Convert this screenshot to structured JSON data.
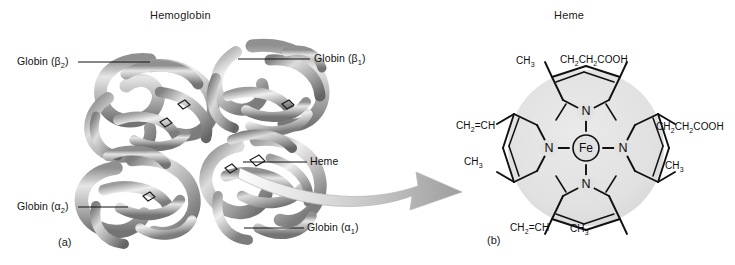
{
  "figure": {
    "panels": [
      {
        "id": "a",
        "caption": "(a)",
        "title": "Hemoglobin",
        "subject": "hemoglobin-quaternary-structure",
        "labels": [
          {
            "name": "globin-beta2",
            "text": "Globin (β",
            "sub": "2",
            "tail": ")"
          },
          {
            "name": "globin-beta1",
            "text": "Globin (β",
            "sub": "1",
            "tail": ")"
          },
          {
            "name": "globin-alpha2",
            "text": "Globin (α",
            "sub": "2",
            "tail": ")"
          },
          {
            "name": "globin-alpha1",
            "text": "Globin (α",
            "sub": "1",
            "tail": ")"
          },
          {
            "name": "heme-callout",
            "text": "Heme",
            "sub": "",
            "tail": ""
          }
        ]
      },
      {
        "id": "b",
        "caption": "(b)",
        "title": "Heme",
        "subject": "heme-iron-porphyrin-structure",
        "center_atom": "Fe",
        "nitrogen_atoms": [
          "N",
          "N",
          "N",
          "N"
        ],
        "substituents": [
          {
            "name": "methyl-top-left",
            "formula_parts": [
              "CH",
              "3"
            ]
          },
          {
            "name": "propionate-top-right",
            "formula_parts": [
              "CH",
              "2",
              "CH",
              "2",
              "COOH"
            ]
          },
          {
            "name": "vinyl-left",
            "formula_parts": [
              "CH",
              "2",
              "=CH"
            ]
          },
          {
            "name": "methyl-left-lower",
            "formula_parts": [
              "CH",
              "3"
            ]
          },
          {
            "name": "propionate-right",
            "formula_parts": [
              "CH",
              "2",
              "CH",
              "2",
              "COOH"
            ]
          },
          {
            "name": "methyl-right-lower",
            "formula_parts": [
              "CH",
              "3"
            ]
          },
          {
            "name": "vinyl-bottom",
            "formula_parts": [
              "CH",
              "2",
              "=CH"
            ]
          },
          {
            "name": "methyl-bottom",
            "formula_parts": [
              "CH",
              "3"
            ]
          }
        ]
      }
    ],
    "connector": {
      "name": "magnification-arrow",
      "direction": "left-to-right"
    },
    "colors": {
      "background": "#ffffff",
      "ink": "#111111",
      "ribbon_light": "#d8d8d8",
      "ribbon_mid": "#a8a8a8",
      "ribbon_dark": "#6e6e6e",
      "heme_disc": "#e2e2e2"
    }
  },
  "labels": {
    "beta2": "Globin (β",
    "beta2_sub": "2",
    "beta2_tail": ")",
    "beta1": "Globin (β",
    "beta1_sub": "1",
    "beta1_tail": ")",
    "alpha2": "Globin (α",
    "alpha2_sub": "2",
    "alpha2_tail": ")",
    "alpha1": "Globin (α",
    "alpha1_sub": "1",
    "alpha1_tail": ")",
    "heme": "Heme"
  },
  "titles": {
    "hemoglobin": "Hemoglobin",
    "heme": "Heme"
  },
  "captions": {
    "a": "(a)",
    "b": "(b)"
  },
  "chem": {
    "ch3": "CH",
    "ch3_sub": "3",
    "vinyl_head": "CH",
    "vinyl_sub": "2",
    "vinyl_tail": "=CH",
    "prop_a": "CH",
    "prop_sub1": "2",
    "prop_b": "CH",
    "prop_sub2": "2",
    "prop_tail": "COOH",
    "fe": "Fe",
    "n": "N"
  }
}
